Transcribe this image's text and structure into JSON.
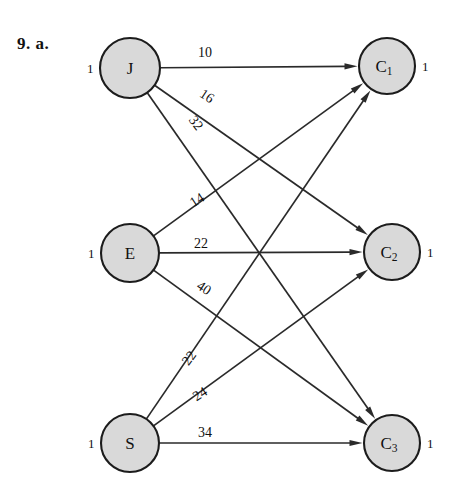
{
  "figure": {
    "problem_label": "9. a.",
    "width": 449,
    "height": 483,
    "background_color": "#ffffff",
    "node_fill_color": "#d9d9d9",
    "node_stroke_color": "#1c1c1c",
    "edge_color": "#2a2a2a",
    "text_color": "#111111"
  },
  "chart_data": {
    "type": "diagram",
    "diagram_kind": "bipartite-assignment-network",
    "title": "9. a.",
    "supply_nodes": [
      {
        "id": "J",
        "label": "J",
        "sub": "",
        "supply": "1",
        "cx": 130,
        "cy": 68,
        "r": 30
      },
      {
        "id": "E",
        "label": "E",
        "sub": "",
        "supply": "1",
        "cx": 130,
        "cy": 253,
        "r": 29
      },
      {
        "id": "S",
        "label": "S",
        "sub": "",
        "supply": "1",
        "cx": 130,
        "cy": 443,
        "r": 29
      }
    ],
    "demand_nodes": [
      {
        "id": "C1",
        "label": "C",
        "sub": "1",
        "demand": "1",
        "cx": 387,
        "cy": 66,
        "r": 28
      },
      {
        "id": "C2",
        "label": "C",
        "sub": "2",
        "demand": "1",
        "cx": 392,
        "cy": 252,
        "r": 28
      },
      {
        "id": "C3",
        "label": "C",
        "sub": "3",
        "demand": "1",
        "cx": 392,
        "cy": 443,
        "r": 28
      }
    ],
    "edges": [
      {
        "from": "J",
        "to": "C1",
        "weight": "10",
        "lx": 205,
        "ly": 52,
        "rot": 0
      },
      {
        "from": "J",
        "to": "C2",
        "weight": "16",
        "lx": 207,
        "ly": 96,
        "rot": 33
      },
      {
        "from": "J",
        "to": "C3",
        "weight": "32",
        "lx": 196,
        "ly": 123,
        "rot": 53
      },
      {
        "from": "E",
        "to": "C1",
        "weight": "14",
        "lx": 197,
        "ly": 200,
        "rot": -33
      },
      {
        "from": "E",
        "to": "C2",
        "weight": "22",
        "lx": 201,
        "ly": 243,
        "rot": 0
      },
      {
        "from": "E",
        "to": "C3",
        "weight": "40",
        "lx": 204,
        "ly": 288,
        "rot": 33
      },
      {
        "from": "S",
        "to": "C1",
        "weight": "22",
        "lx": 189,
        "ly": 358,
        "rot": -54
      },
      {
        "from": "S",
        "to": "C2",
        "weight": "24",
        "lx": 200,
        "ly": 394,
        "rot": -33
      },
      {
        "from": "S",
        "to": "C3",
        "weight": "34",
        "lx": 205,
        "ly": 432,
        "rot": 0
      }
    ],
    "xlabel": "",
    "ylabel": "",
    "legend": [],
    "annotations": [
      "Each left node J, E, S has supply 1",
      "Each right node C1, C2, C3 has demand 1",
      "Directed arcs point from supply nodes to demand nodes, labeled with cost"
    ]
  }
}
